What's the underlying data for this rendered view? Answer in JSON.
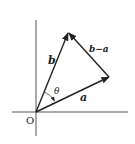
{
  "diagram": {
    "type": "vector-diagram",
    "origin_label": "O",
    "angle_label": "θ",
    "vectors": [
      {
        "name": "a",
        "label": "a",
        "from": "O",
        "to": "A"
      },
      {
        "name": "b",
        "label": "b",
        "from": "O",
        "to": "B"
      },
      {
        "name": "b-a",
        "label": "b−a",
        "from": "A",
        "to": "B"
      }
    ],
    "colors": {
      "stroke": "#222222",
      "background": "#ffffff"
    }
  }
}
